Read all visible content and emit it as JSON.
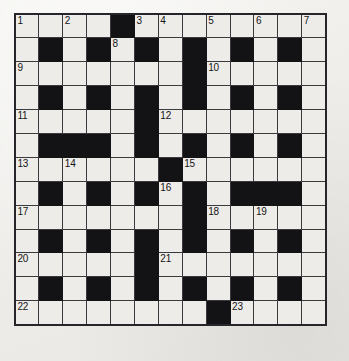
{
  "puzzle": {
    "type": "crossword-grid",
    "title": "Crossword Puzzle Grid",
    "rows": 13,
    "columns": 13,
    "colors": {
      "block": "#131316",
      "open_cell": "#eeece8",
      "grid_line": "#3a3a3e",
      "border": "#26262a",
      "number_text": "#141417",
      "page_background": "#f2f1ee"
    },
    "legend": {
      "black_note": "1 = blocked (black) square, 0 = open (writable) square"
    },
    "blocked_grid": [
      [
        0,
        0,
        0,
        0,
        1,
        0,
        0,
        0,
        0,
        0,
        0,
        0,
        0
      ],
      [
        0,
        1,
        0,
        1,
        0,
        1,
        0,
        1,
        0,
        1,
        0,
        1,
        0
      ],
      [
        0,
        0,
        0,
        0,
        0,
        0,
        0,
        1,
        0,
        0,
        0,
        0,
        0
      ],
      [
        0,
        1,
        0,
        1,
        0,
        1,
        0,
        1,
        0,
        1,
        0,
        1,
        0
      ],
      [
        0,
        0,
        0,
        0,
        0,
        1,
        0,
        0,
        0,
        0,
        0,
        0,
        0
      ],
      [
        0,
        1,
        1,
        1,
        0,
        1,
        0,
        1,
        0,
        1,
        0,
        1,
        0
      ],
      [
        0,
        0,
        0,
        0,
        0,
        0,
        1,
        0,
        0,
        0,
        0,
        0,
        0
      ],
      [
        0,
        1,
        0,
        1,
        0,
        1,
        0,
        1,
        0,
        1,
        1,
        1,
        0
      ],
      [
        0,
        0,
        0,
        0,
        0,
        0,
        0,
        1,
        0,
        0,
        0,
        0,
        0
      ],
      [
        0,
        1,
        0,
        1,
        0,
        1,
        0,
        1,
        0,
        1,
        0,
        1,
        0
      ],
      [
        0,
        0,
        0,
        0,
        0,
        1,
        0,
        0,
        0,
        0,
        0,
        0,
        0
      ],
      [
        0,
        1,
        0,
        1,
        0,
        1,
        0,
        1,
        0,
        1,
        0,
        1,
        0
      ],
      [
        0,
        0,
        0,
        0,
        0,
        0,
        0,
        0,
        1,
        0,
        0,
        0,
        0
      ]
    ],
    "numbers": [
      {
        "number": "1",
        "row": 1,
        "col": 1
      },
      {
        "number": "2",
        "row": 1,
        "col": 3
      },
      {
        "number": "3",
        "row": 1,
        "col": 6
      },
      {
        "number": "4",
        "row": 1,
        "col": 7
      },
      {
        "number": "5",
        "row": 1,
        "col": 9
      },
      {
        "number": "6",
        "row": 1,
        "col": 11
      },
      {
        "number": "7",
        "row": 1,
        "col": 13
      },
      {
        "number": "8",
        "row": 2,
        "col": 5
      },
      {
        "number": "9",
        "row": 3,
        "col": 1
      },
      {
        "number": "10",
        "row": 3,
        "col": 9
      },
      {
        "number": "11",
        "row": 5,
        "col": 1
      },
      {
        "number": "12",
        "row": 5,
        "col": 7
      },
      {
        "number": "13",
        "row": 7,
        "col": 1
      },
      {
        "number": "14",
        "row": 7,
        "col": 3
      },
      {
        "number": "15",
        "row": 7,
        "col": 8
      },
      {
        "number": "16",
        "row": 8,
        "col": 7
      },
      {
        "number": "17",
        "row": 9,
        "col": 1
      },
      {
        "number": "18",
        "row": 9,
        "col": 9
      },
      {
        "number": "19",
        "row": 9,
        "col": 11
      },
      {
        "number": "20",
        "row": 11,
        "col": 1
      },
      {
        "number": "21",
        "row": 11,
        "col": 7
      },
      {
        "number": "22",
        "row": 13,
        "col": 1
      },
      {
        "number": "23",
        "row": 13,
        "col": 10
      }
    ]
  }
}
